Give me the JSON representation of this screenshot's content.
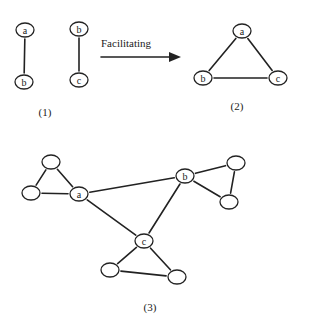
{
  "diagram": {
    "arrow": {
      "label": "Facilitating",
      "x1": 101,
      "y1": 57,
      "x2": 170,
      "y2": 57
    },
    "panels": [
      {
        "caption": "(1)",
        "caption_pos": [
          45,
          116
        ],
        "nodes": [
          {
            "id": "p1a",
            "label": "a",
            "x": 25,
            "y": 30
          },
          {
            "id": "p1b",
            "label": "b",
            "x": 24,
            "y": 82
          },
          {
            "id": "p1b2",
            "label": "b",
            "x": 79,
            "y": 29
          },
          {
            "id": "p1c",
            "label": "c",
            "x": 79,
            "y": 80
          }
        ],
        "edges": [
          [
            "p1a",
            "p1b"
          ],
          [
            "p1b2",
            "p1c"
          ]
        ]
      },
      {
        "caption": "(2)",
        "caption_pos": [
          237,
          110
        ],
        "nodes": [
          {
            "id": "p2a",
            "label": "a",
            "x": 242,
            "y": 31
          },
          {
            "id": "p2b",
            "label": "b",
            "x": 203,
            "y": 78
          },
          {
            "id": "p2c",
            "label": "c",
            "x": 278,
            "y": 78
          }
        ],
        "edges": [
          [
            "p2a",
            "p2b"
          ],
          [
            "p2a",
            "p2c"
          ],
          [
            "p2b",
            "p2c"
          ]
        ]
      },
      {
        "caption": "(3)",
        "caption_pos": [
          150,
          311
        ],
        "nodes": [
          {
            "id": "p3tl",
            "label": "",
            "x": 51,
            "y": 162
          },
          {
            "id": "p3l",
            "label": "",
            "x": 31,
            "y": 193
          },
          {
            "id": "p3a",
            "label": "a",
            "x": 79,
            "y": 194
          },
          {
            "id": "p3b",
            "label": "b",
            "x": 185,
            "y": 176
          },
          {
            "id": "p3tr",
            "label": "",
            "x": 236,
            "y": 163
          },
          {
            "id": "p3r",
            "label": "",
            "x": 229,
            "y": 202
          },
          {
            "id": "p3c",
            "label": "c",
            "x": 144,
            "y": 241
          },
          {
            "id": "p3bl",
            "label": "",
            "x": 110,
            "y": 270
          },
          {
            "id": "p3br",
            "label": "",
            "x": 177,
            "y": 277
          }
        ],
        "edges": [
          [
            "p3tl",
            "p3l"
          ],
          [
            "p3tl",
            "p3a"
          ],
          [
            "p3l",
            "p3a"
          ],
          [
            "p3a",
            "p3b"
          ],
          [
            "p3a",
            "p3c"
          ],
          [
            "p3b",
            "p3tr"
          ],
          [
            "p3b",
            "p3r"
          ],
          [
            "p3tr",
            "p3r"
          ],
          [
            "p3b",
            "p3c"
          ],
          [
            "p3c",
            "p3bl"
          ],
          [
            "p3c",
            "p3br"
          ],
          [
            "p3bl",
            "p3br"
          ]
        ]
      }
    ]
  }
}
